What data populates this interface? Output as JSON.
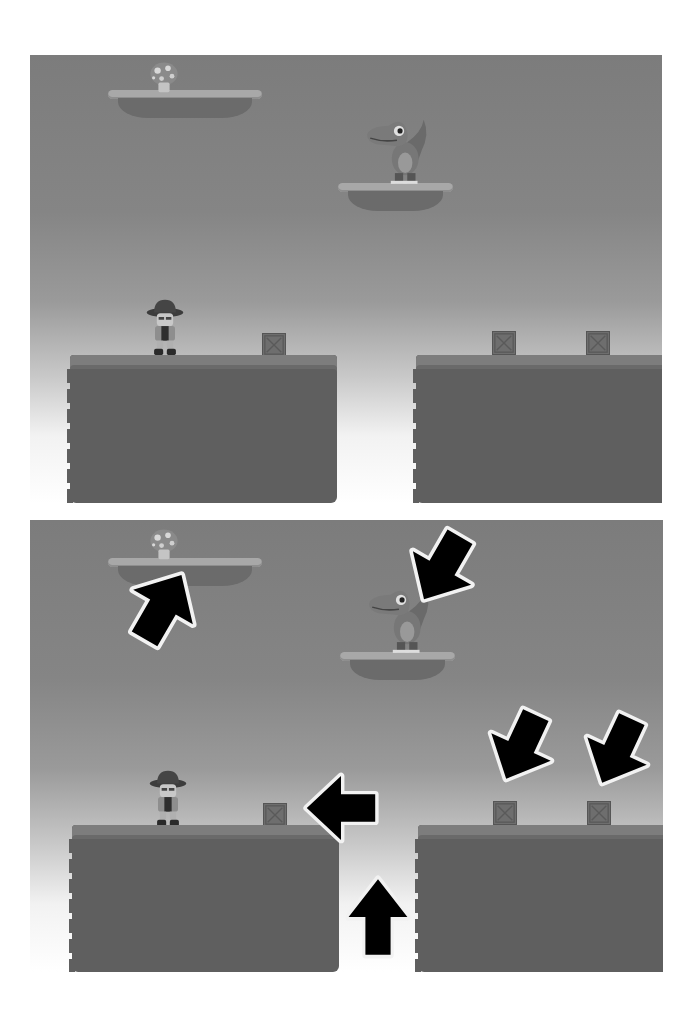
{
  "figure": {
    "layout": "two stacked game screenshots",
    "colors": {
      "sky_top": "#7c7c7c",
      "sky_bottom": "#ffffff",
      "ground": "#5f5f5f",
      "platform_top": "#a8a8a8",
      "crate": "#6e6e6e",
      "arrow_fill": "#000000",
      "arrow_outline": "#f2f2f2"
    }
  },
  "panels": [
    {
      "id": "top",
      "label": "game scene",
      "objects": {
        "mushroom": "mushroom-powerup",
        "dino": "dinosaur-enemy",
        "player": "explorer-character",
        "crates": 3,
        "floating_platforms": 2,
        "ground_blocks": 2
      },
      "arrows": []
    },
    {
      "id": "bottom",
      "label": "annotated game scene",
      "objects": {
        "mushroom": "mushroom-powerup",
        "dino": "dinosaur-enemy",
        "player": "explorer-character",
        "crates": 3,
        "floating_platforms": 2,
        "ground_blocks": 2
      },
      "arrows": [
        {
          "target": "mushroom",
          "direction": "up-right"
        },
        {
          "target": "dino",
          "direction": "down-left"
        },
        {
          "target": "left-crate",
          "direction": "left"
        },
        {
          "target": "pit-gap",
          "direction": "up"
        },
        {
          "target": "right-crate-1",
          "direction": "down-left"
        },
        {
          "target": "right-crate-2",
          "direction": "down-left"
        }
      ]
    }
  ]
}
